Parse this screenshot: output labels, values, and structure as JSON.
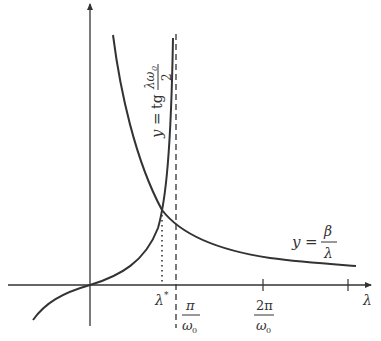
{
  "diagram": {
    "colors": {
      "stroke": "#333333",
      "background": "#ffffff"
    },
    "axes": {
      "x_label": "λ",
      "ticks": [
        {
          "num": "π",
          "den": "ω",
          "den_sub": "0"
        },
        {
          "num": "2π",
          "den": "ω",
          "den_sub": "0"
        }
      ]
    },
    "curves": {
      "tangent": {
        "y": "y",
        "eq": "=",
        "fn": "tg",
        "frac_num": "λω",
        "frac_num_sub": "0",
        "frac_den": "2"
      },
      "hyperbola": {
        "y": "y",
        "eq": "=",
        "frac_num": "β",
        "frac_den": "λ"
      }
    },
    "intersection": {
      "label": "λ",
      "sup": "*"
    }
  }
}
